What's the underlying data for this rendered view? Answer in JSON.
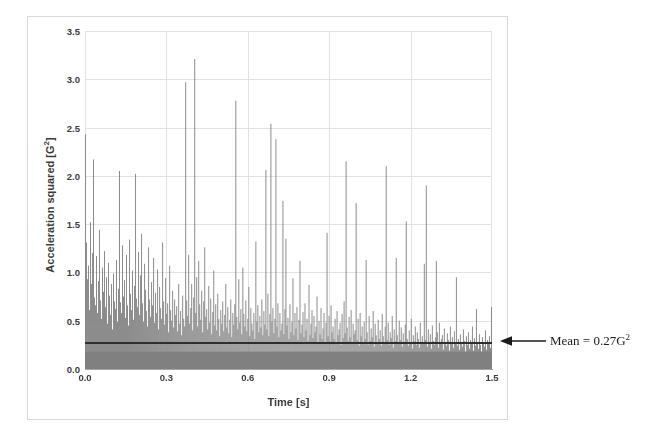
{
  "chart_data": {
    "type": "bar",
    "title": "",
    "subtitle": "",
    "xlabel": "Time [s]",
    "ylabel": "Acceleration squared [G²]",
    "ylabel_base": "Acceleration squared [G",
    "ylabel_sup": "2",
    "ylabel_tail": "]",
    "xlim": [
      0.0,
      1.5
    ],
    "ylim": [
      0.0,
      3.5
    ],
    "xticks": [
      "0.0",
      "0.3",
      "0.6",
      "0.9",
      "1.2",
      "1.5"
    ],
    "xtick_values": [
      0.0,
      0.3,
      0.6,
      0.9,
      1.2,
      1.5
    ],
    "yticks": [
      "0.0",
      "0.5",
      "1.0",
      "1.5",
      "2.0",
      "2.5",
      "3.0",
      "3.5"
    ],
    "ytick_values": [
      0.0,
      0.5,
      1.0,
      1.5,
      2.0,
      2.5,
      3.0,
      3.5
    ],
    "grid": true,
    "legend": "none",
    "bar_color": "#808080",
    "mean_line_color": "#2f2f2f",
    "grid_color": "#e2e2e2",
    "mean_value": 0.27,
    "annotation": {
      "text": "Mean = 0.27G²",
      "text_base": "Mean = 0.27G",
      "text_sup": "2",
      "arrow": "left-arrow",
      "points_to_y": 0.27
    },
    "series": [
      {
        "name": "Acceleration squared",
        "x_start": 0.0,
        "x_end": 1.5,
        "n_points": 406,
        "values": [
          2.43,
          1.31,
          0.93,
          1.07,
          0.61,
          1.52,
          0.88,
          1.2,
          2.17,
          0.74,
          0.66,
          1.17,
          0.58,
          0.91,
          1.44,
          0.71,
          0.52,
          1.05,
          0.8,
          1.22,
          0.64,
          0.95,
          0.47,
          1.1,
          0.76,
          0.56,
          0.88,
          0.41,
          0.99,
          0.7,
          0.62,
          1.13,
          0.49,
          0.83,
          2.05,
          0.69,
          0.58,
          1.28,
          0.75,
          0.92,
          0.53,
          1.18,
          0.66,
          0.45,
          1.34,
          0.78,
          0.61,
          1.02,
          0.51,
          0.86,
          2.02,
          0.73,
          0.64,
          1.21,
          0.56,
          0.97,
          1.4,
          0.68,
          0.49,
          1.09,
          0.82,
          0.6,
          0.44,
          1.26,
          0.72,
          0.54,
          0.9,
          0.66,
          1.15,
          0.48,
          0.79,
          0.58,
          1.03,
          0.41,
          0.85,
          0.63,
          0.52,
          1.31,
          0.7,
          0.46,
          0.94,
          0.57,
          0.68,
          0.38,
          1.07,
          0.61,
          0.5,
          0.81,
          0.43,
          0.72,
          0.56,
          0.65,
          0.39,
          0.88,
          0.47,
          0.6,
          0.35,
          0.76,
          0.52,
          0.44,
          2.97,
          0.71,
          0.55,
          1.18,
          0.47,
          0.63,
          0.88,
          0.4,
          0.74,
          3.21,
          0.58,
          0.95,
          0.44,
          1.12,
          0.67,
          0.51,
          0.81,
          0.38,
          0.7,
          1.26,
          0.54,
          0.62,
          0.41,
          0.86,
          0.48,
          0.73,
          0.36,
          0.59,
          1.02,
          0.45,
          0.67,
          0.4,
          0.78,
          0.52,
          0.34,
          0.61,
          0.47,
          0.7,
          0.39,
          0.56,
          0.88,
          0.43,
          0.64,
          0.37,
          0.51,
          0.72,
          0.33,
          0.58,
          0.46,
          0.67,
          2.78,
          0.54,
          0.41,
          0.93,
          0.48,
          0.62,
          0.36,
          1.05,
          0.57,
          0.44,
          0.71,
          0.39,
          0.52,
          0.85,
          0.34,
          0.63,
          0.47,
          0.4,
          0.58,
          0.31,
          1.32,
          0.49,
          0.66,
          0.38,
          0.55,
          0.43,
          0.72,
          0.35,
          0.6,
          0.46,
          2.06,
          0.41,
          0.78,
          0.34,
          0.57,
          2.54,
          0.49,
          0.63,
          0.37,
          0.52,
          2.38,
          0.44,
          0.68,
          0.33,
          0.58,
          0.4,
          0.47,
          1.74,
          0.36,
          0.62,
          1.35,
          0.45,
          0.53,
          0.31,
          0.67,
          0.38,
          0.49,
          0.94,
          0.35,
          0.58,
          0.42,
          0.64,
          0.3,
          0.51,
          1.12,
          0.37,
          0.46,
          0.59,
          0.33,
          0.68,
          0.4,
          0.52,
          0.29,
          0.87,
          0.35,
          0.47,
          0.61,
          0.32,
          0.55,
          0.38,
          0.44,
          0.75,
          0.28,
          0.5,
          0.36,
          0.63,
          0.31,
          0.42,
          0.58,
          0.26,
          0.48,
          1.41,
          0.34,
          0.55,
          0.29,
          0.66,
          0.38,
          0.44,
          0.31,
          0.52,
          0.27,
          0.6,
          0.35,
          0.41,
          0.48,
          0.25,
          0.57,
          0.32,
          0.7,
          0.37,
          2.15,
          0.43,
          0.29,
          0.54,
          0.33,
          0.61,
          0.26,
          0.47,
          0.36,
          0.4,
          1.72,
          0.3,
          0.52,
          0.24,
          0.58,
          0.34,
          0.44,
          0.28,
          0.49,
          0.31,
          1.13,
          0.38,
          0.25,
          0.55,
          0.29,
          0.42,
          0.33,
          0.6,
          0.23,
          0.47,
          0.35,
          0.27,
          0.51,
          0.31,
          0.4,
          0.24,
          0.57,
          0.34,
          0.28,
          0.44,
          2.1,
          0.3,
          0.48,
          0.25,
          0.38,
          0.32,
          0.55,
          0.22,
          0.41,
          0.29,
          1.15,
          0.35,
          0.26,
          0.5,
          0.3,
          0.43,
          0.23,
          0.37,
          0.28,
          0.46,
          1.53,
          0.31,
          0.24,
          0.4,
          0.27,
          0.52,
          0.21,
          0.35,
          0.29,
          0.44,
          0.25,
          0.38,
          0.31,
          0.22,
          0.48,
          0.28,
          0.34,
          0.26,
          1.09,
          0.3,
          1.9,
          0.23,
          0.41,
          0.27,
          0.36,
          0.21,
          0.45,
          0.29,
          0.25,
          0.33,
          1.12,
          0.38,
          0.22,
          0.48,
          0.26,
          0.31,
          0.35,
          0.2,
          0.42,
          0.28,
          0.24,
          0.37,
          0.3,
          0.19,
          0.44,
          0.26,
          0.33,
          0.22,
          0.39,
          0.28,
          0.95,
          0.24,
          0.31,
          0.2,
          0.36,
          0.27,
          0.23,
          0.41,
          0.29,
          0.18,
          0.34,
          0.25,
          0.38,
          0.21,
          0.3,
          0.26,
          0.44,
          0.19,
          0.32,
          0.24,
          0.62,
          0.28,
          0.21,
          0.36,
          0.25,
          0.18,
          0.33,
          0.27,
          0.23,
          0.4,
          0.2,
          0.3,
          0.26,
          0.34,
          0.22,
          0.64
        ]
      }
    ]
  }
}
